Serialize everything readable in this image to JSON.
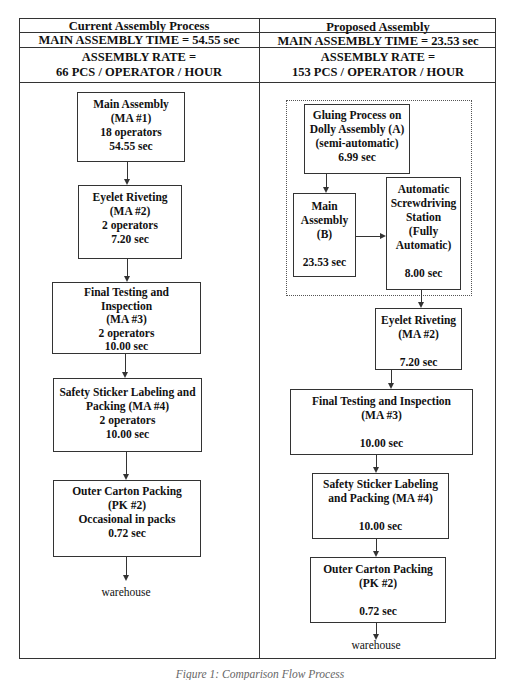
{
  "current": {
    "title": "Current Assembly Process",
    "main_time": "MAIN ASSEMBLY TIME = 54.55 sec",
    "rate_label": "ASSEMBLY RATE =",
    "rate_value": "66  PCS / OPERATOR / HOUR",
    "steps": [
      {
        "lines": [
          "Main Assembly",
          "(MA #1)",
          "18 operators",
          "54.55 sec"
        ]
      },
      {
        "lines": [
          "Eyelet  Riveting",
          "(MA #2)",
          "2 operators",
          "7.20 sec"
        ]
      },
      {
        "lines": [
          "Final Testing and",
          "Inspection",
          "(MA #3)",
          "2 operators",
          "10.00 sec"
        ]
      },
      {
        "lines": [
          "Safety Sticker Labeling and",
          "Packing (MA #4)",
          "2 operators",
          "10.00 sec"
        ]
      },
      {
        "lines": [
          "Outer Carton Packing",
          "(PK #2)",
          "Occasional in packs",
          "0.72 sec"
        ]
      }
    ],
    "end_label": "warehouse"
  },
  "proposed": {
    "title": "Proposed Assembly",
    "main_time": "MAIN ASSEMBLY TIME =  23.53 sec",
    "rate_label": "ASSEMBLY RATE =",
    "rate_value": "153 PCS / OPERATOR / HOUR",
    "gluing": {
      "lines": [
        "Gluing Process on",
        "Dolly Assembly (A)",
        "(semi-automatic)",
        "6.99 sec"
      ]
    },
    "main_b": {
      "lines": [
        "Main",
        "Assembly",
        "(B)",
        "23.53 sec"
      ]
    },
    "screw": {
      "lines": [
        "Automatic",
        "Screwdriving",
        "Station",
        "(Fully",
        "Automatic)",
        "8.00 sec"
      ]
    },
    "steps": [
      {
        "lines": [
          "Eyelet  Riveting",
          "(MA #2)",
          "7.20 sec"
        ]
      },
      {
        "lines": [
          "Final Testing and Inspection",
          "(MA #3)",
          "10.00 sec"
        ]
      },
      {
        "lines": [
          "Safety Sticker Labeling",
          "and  Packing (MA #4)",
          "10.00 sec"
        ]
      },
      {
        "lines": [
          "Outer Carton Packing",
          "(PK #2)",
          "0.72 sec"
        ]
      }
    ],
    "end_label": "warehouse"
  },
  "caption": "Figure 1: Comparison Flow Process"
}
